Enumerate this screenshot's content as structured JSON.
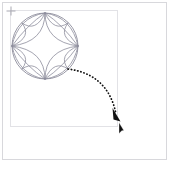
{
  "canvas": {
    "width": 171,
    "height": 170,
    "background_color": "#ffffff",
    "outer_frame_color": "#d8d8dc",
    "inner_frame_color": "#e2e2e6"
  },
  "artwork": {
    "name": "four-petal-rosette",
    "description": "Circle containing a four-petal rosette / astroid motif drawn in thin gray-violet strokes",
    "stroke_color": "#8d8d9c",
    "center_x": 45,
    "center_y": 46,
    "radius": 33,
    "petal_count": 4
  },
  "handle": {
    "name": "transform-handle",
    "label": "",
    "x": 11,
    "y": 11,
    "color": "#b0b0b8"
  },
  "gesture": {
    "type": "drag",
    "stroke_color": "#111111",
    "style": "dotted-curve-with-arrowhead",
    "start_x": 68,
    "start_y": 69,
    "end_x": 118,
    "end_y": 120,
    "arrowhead": "filled-triangle"
  },
  "cursor": {
    "name": "mouse-pointer",
    "x": 120,
    "y": 127,
    "color": "#111111"
  }
}
